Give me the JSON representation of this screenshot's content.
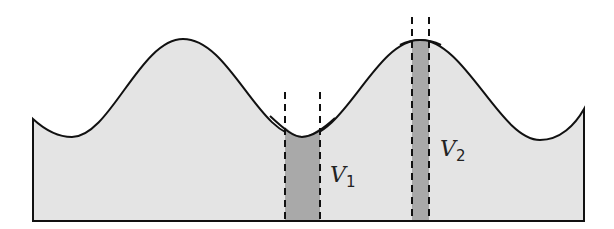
{
  "diagram": {
    "colors": {
      "fill": "#e4e4e4",
      "column_fill": "#a9a9a9",
      "stroke": "#111111"
    },
    "labels": {
      "v1": {
        "main": "V",
        "sub": "1"
      },
      "v2": {
        "main": "V",
        "sub": "2"
      }
    }
  }
}
